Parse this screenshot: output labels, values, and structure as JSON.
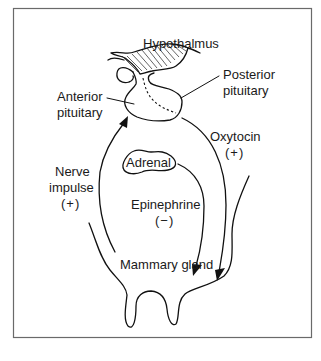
{
  "diagram": {
    "labels": {
      "hypothalamus": "Hypothalmus",
      "posterior_pituitary_line1": "Posterior",
      "posterior_pituitary_line2": "pituitary",
      "anterior_pituitary_line1": "Anterior",
      "anterior_pituitary_line2": "pituitary",
      "oxytocin": "Oxytocin",
      "oxytocin_sign": "(+)",
      "nerve_line1": "Nerve",
      "nerve_line2": "impulse",
      "nerve_sign": "(+)",
      "adrenal": "Adrenal",
      "epinephrine": "Epinephrine",
      "epinephrine_sign": "(−)",
      "mammary_gland": "Mammary gland"
    },
    "edges": [
      {
        "from": "Mammary gland",
        "to": "Anterior pituitary",
        "label": "Nerve impulse",
        "effect": "+"
      },
      {
        "from": "Posterior pituitary",
        "to": "Mammary gland",
        "label": "Oxytocin",
        "effect": "+"
      },
      {
        "from": "Adrenal",
        "to": "Mammary gland",
        "label": "Epinephrine",
        "effect": "−"
      }
    ]
  }
}
